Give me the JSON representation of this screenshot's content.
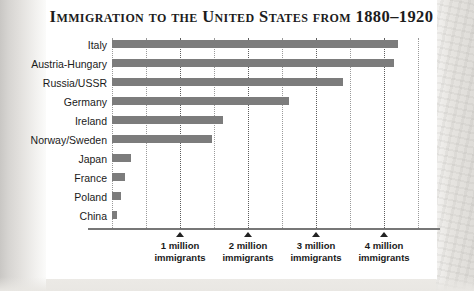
{
  "chart_data": {
    "type": "bar",
    "orientation": "horizontal",
    "title": "Immigration to the United States from 1880–1920",
    "xlabel": "",
    "ylabel": "",
    "xlim": [
      0,
      4.6
    ],
    "xtick_values": [
      1,
      2,
      3,
      4
    ],
    "xtick_labels": [
      "1 million\nimmigrants",
      "2 million\nimmigrants",
      "3 million\nimmigrants",
      "4 million\nimmigrants"
    ],
    "xtick_label_lines": [
      {
        "line1": "1 million",
        "line2": "immigrants"
      },
      {
        "line1": "2 million",
        "line2": "immigrants"
      },
      {
        "line1": "3 million",
        "line2": "immigrants"
      },
      {
        "line1": "4 million",
        "line2": "immigrants"
      }
    ],
    "units": "millions of immigrants",
    "grid": true,
    "grid_axis": "x",
    "grid_style": "dotted",
    "grid_minor_interval": 0.5,
    "legend": false,
    "bar_color": "#7c7c7c",
    "categories": [
      "Italy",
      "Austria-Hungary",
      "Russia/USSR",
      "Germany",
      "Ireland",
      "Norway/Sweden",
      "Japan",
      "France",
      "Poland",
      "China"
    ],
    "values": [
      4.2,
      4.15,
      3.4,
      2.6,
      1.63,
      1.47,
      0.28,
      0.19,
      0.13,
      0.07
    ],
    "bars": [
      {
        "category": "Italy",
        "value": 4.2
      },
      {
        "category": "Austria-Hungary",
        "value": 4.15
      },
      {
        "category": "Russia/USSR",
        "value": 3.4
      },
      {
        "category": "Germany",
        "value": 2.6
      },
      {
        "category": "Ireland",
        "value": 1.63
      },
      {
        "category": "Norway/Sweden",
        "value": 1.47
      },
      {
        "category": "Japan",
        "value": 0.28
      },
      {
        "category": "France",
        "value": 0.19
      },
      {
        "category": "Poland",
        "value": 0.13
      },
      {
        "category": "China",
        "value": 0.07
      }
    ]
  }
}
